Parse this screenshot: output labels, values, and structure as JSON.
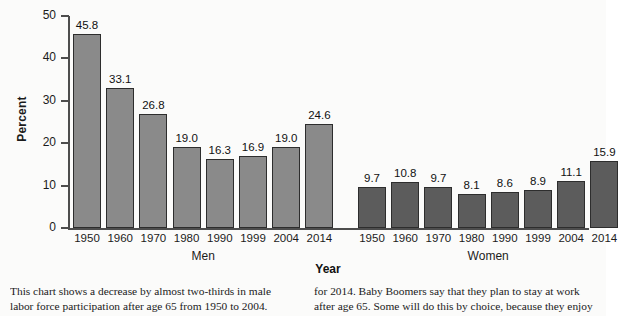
{
  "chart_data": {
    "type": "bar",
    "title": "",
    "xlabel": "Year",
    "ylabel": "Percent",
    "ylim": [
      0,
      50
    ],
    "ytick_values": [
      50,
      40,
      30,
      20,
      10,
      0
    ],
    "ytick_labels": [
      "50",
      "40",
      "30",
      "20",
      "10",
      "0"
    ],
    "grid": false,
    "legend": "none",
    "categories": [
      "1950",
      "1960",
      "1970",
      "1980",
      "1990",
      "1999",
      "2004",
      "2014"
    ],
    "groups": [
      {
        "name": "Men",
        "color": "#8a8a8a",
        "categories": [
          "1950",
          "1960",
          "1970",
          "1980",
          "1990",
          "1999",
          "2004",
          "2014"
        ],
        "values": [
          45.8,
          33.1,
          26.8,
          19.0,
          16.3,
          16.9,
          19.0,
          24.6
        ],
        "value_labels": [
          "45.8",
          "33.1",
          "26.8",
          "19.0",
          "16.3",
          "16.9",
          "19.0",
          "24.6"
        ]
      },
      {
        "name": "Women",
        "color": "#5c5c5c",
        "categories": [
          "1950",
          "1960",
          "1970",
          "1980",
          "1990",
          "1999",
          "2004",
          "2014"
        ],
        "values": [
          9.7,
          10.8,
          9.7,
          8.1,
          8.6,
          8.9,
          11.1,
          15.9
        ],
        "value_labels": [
          "9.7",
          "10.8",
          "9.7",
          "8.1",
          "8.6",
          "8.9",
          "11.1",
          "15.9"
        ]
      }
    ]
  },
  "caption": {
    "left_column": "This chart shows a decrease by almost two-thirds in male labor force participation after age 65 from 1950 to 2004. Many older",
    "right_column": "for 2014. Baby Boomers say that they plan to stay at work after age 65. Some will do this by choice, because they enjoy the"
  }
}
